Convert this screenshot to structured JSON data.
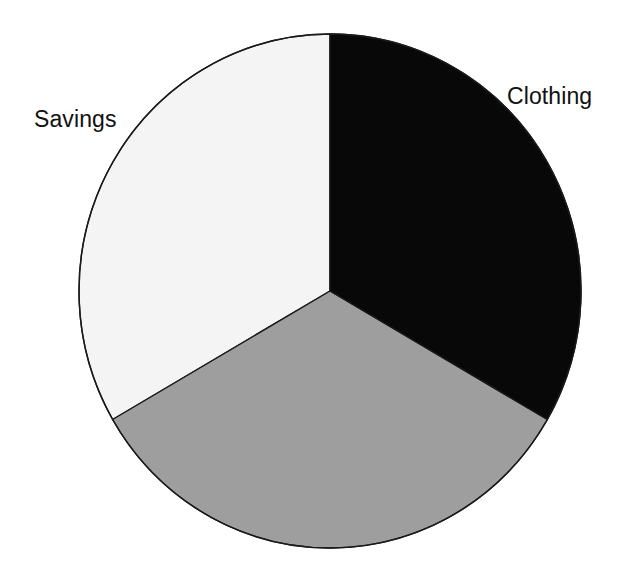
{
  "background_color": "#ffffff",
  "labels": {
    "savings": "Savings",
    "clothing": "Clothing"
  },
  "chart_data": {
    "type": "pie",
    "title": "",
    "subtitle": "",
    "xlabel": "",
    "ylabel": "",
    "grid": false,
    "legend": "none",
    "labels_position": "outside",
    "start_angle_deg": 0,
    "direction": "clockwise",
    "center": {
      "x": 330,
      "y": 291
    },
    "radius": {
      "rx": 251,
      "ry": 257
    },
    "outline_color": "#1a1a1a",
    "outline_width": 1.4,
    "slices": [
      {
        "label": "Clothing",
        "value": 33.3,
        "percent": "33.3%",
        "color": "#080808",
        "start_angle_deg": 0,
        "end_angle_deg": 120,
        "label_shown": true,
        "label_placement": "outside-upper-right"
      },
      {
        "label": "",
        "value": 33.3,
        "percent": "33.3%",
        "color": "#9e9e9e",
        "start_angle_deg": 120,
        "end_angle_deg": 240,
        "label_shown": false,
        "label_placement": "none"
      },
      {
        "label": "Savings",
        "value": 33.4,
        "percent": "33.4%",
        "color": "#f4f4f4",
        "start_angle_deg": 240,
        "end_angle_deg": 360,
        "label_shown": true,
        "label_placement": "outside-upper-left"
      }
    ],
    "colors": [
      "#080808",
      "#9e9e9e",
      "#f4f4f4"
    ],
    "categories": [
      "Clothing",
      "",
      "Savings"
    ],
    "values": [
      33.3,
      33.3,
      33.4
    ]
  },
  "geometry": {
    "slice_clothing_path": "M 330 291 L 330 34 A 251 257 0 0 1 547.3 419.5 Z",
    "slice_gray_path": "M 330 291 L 547.3 419.5 A 251 257 0 0 1 112.7 419.5 Z",
    "slice_savings_path": "M 330 291 L 112.7 419.5 A 251 257 0 0 1 330 34 Z"
  }
}
